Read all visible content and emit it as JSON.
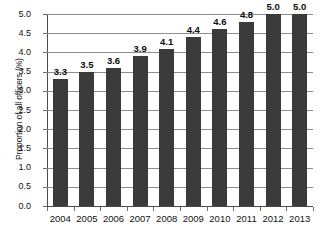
{
  "chart_data": {
    "type": "bar",
    "title": "",
    "xlabel": "",
    "ylabel": "Proportion of all officers (%)",
    "categories": [
      "2004",
      "2005",
      "2006",
      "2007",
      "2008",
      "2009",
      "2010",
      "2011",
      "2012",
      "2013"
    ],
    "values": [
      3.3,
      3.5,
      3.6,
      3.9,
      4.1,
      4.4,
      4.6,
      4.8,
      5.0,
      5.0
    ],
    "value_labels": [
      "3.3",
      "3.5",
      "3.6",
      "3.9",
      "4.1",
      "4.4",
      "4.6",
      "4.8",
      "5.0",
      "5.0"
    ],
    "series": [
      {
        "name": "Proportion of all officers (%)",
        "values": [
          3.3,
          3.5,
          3.6,
          3.9,
          4.1,
          4.4,
          4.6,
          4.8,
          5.0,
          5.0
        ]
      }
    ],
    "ylim": [
      0.0,
      5.0
    ],
    "ytick_labels": [
      "0.0",
      "0.5",
      "1.0",
      "1.5",
      "2.0",
      "2.5",
      "3.0",
      "3.5",
      "4.0",
      "4.5",
      "5.0"
    ],
    "ytick_values": [
      0.0,
      0.5,
      1.0,
      1.5,
      2.0,
      2.5,
      3.0,
      3.5,
      4.0,
      4.5,
      5.0
    ],
    "grid": true,
    "legend": false,
    "legend_position": "none",
    "bar_color": "#3b3b3b",
    "gridline_color": "#8e8e8e",
    "axis_color": "#4a4a4a",
    "background_color": "#ffffff",
    "data_labels_shown": true
  }
}
